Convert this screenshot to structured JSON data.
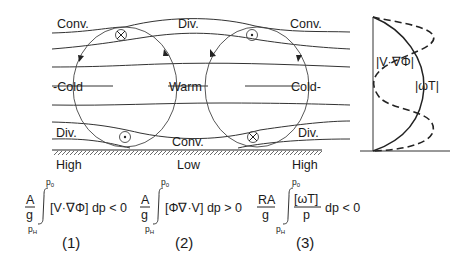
{
  "cross_section": {
    "top_labels": [
      "Conv.",
      "Div.",
      "Conv."
    ],
    "middle_labels": [
      "-Cold",
      "Warm",
      "Cold-"
    ],
    "bottom_labels": [
      "Div.",
      "Conv.",
      "Div."
    ],
    "surface_labels": [
      "High",
      "Low",
      "High"
    ],
    "symbols": {
      "top_left": "into-page (⊗)",
      "top_right": "out-of-page (⊙)",
      "bottom_left": "out-of-page (⊙)",
      "bottom_right": "into-page (⊗)"
    }
  },
  "equations": [
    {
      "coef_num": "A",
      "coef_den": "g",
      "upper": "p0",
      "lower": "pH",
      "integrand": "[V·∇Φ] dp < 0",
      "number": "(1)"
    },
    {
      "coef_num": "A",
      "coef_den": "g",
      "upper": "p0",
      "lower": "pH",
      "integrand": "[Φ∇·V] dp > 0",
      "number": "(2)"
    },
    {
      "coef_num": "RA",
      "coef_den": "g",
      "upper": "p0",
      "lower": "pH",
      "frac_num": "[ωT]",
      "frac_den": "p",
      "integrand": "dp < 0",
      "number": "(3)"
    }
  ],
  "profile": {
    "dashed_label": "|V·∇Φ|",
    "solid_label": "|ωT|"
  }
}
